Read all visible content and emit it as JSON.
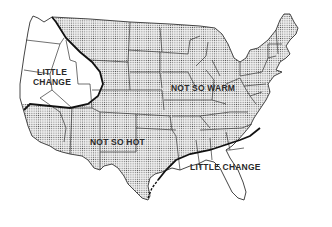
{
  "map": {
    "type": "region-map",
    "subject": "Contiguous United States",
    "regions": [
      {
        "id": "west-coast",
        "label_line1": "LITTLE",
        "label_line2": "CHANGE",
        "shaded": false
      },
      {
        "id": "north-central",
        "label": "NOT SO WARM",
        "shaded": true
      },
      {
        "id": "southwest",
        "label": "NOT SO HOT",
        "shaded": true
      },
      {
        "id": "gulf-coast",
        "label": "LITTLE CHANGE",
        "shaded": false
      }
    ],
    "colors": {
      "shaded_fill": "#d9d9d9",
      "border": "#333333",
      "region_boundary": "#111111",
      "background": "#ffffff"
    }
  }
}
